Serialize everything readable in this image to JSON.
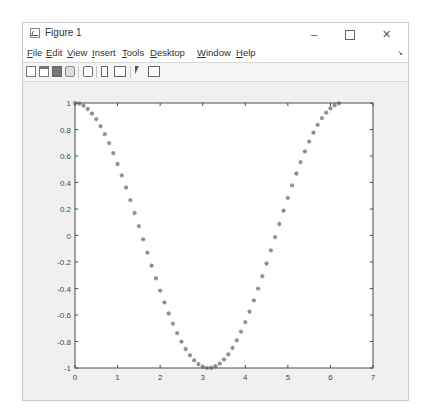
{
  "window": {
    "title": "Figure 1",
    "controls": {
      "minimize": "–",
      "maximize": "□",
      "close": "✕"
    }
  },
  "menubar": {
    "items": [
      "File",
      "Edit",
      "View",
      "Insert",
      "Tools",
      "Desktop",
      "Window",
      "Help"
    ],
    "dock_arrow": "↘"
  },
  "toolbar": {
    "icons": [
      "new-figure-icon",
      "open-file-icon",
      "save-icon",
      "print-icon",
      "zoom-icon",
      "insert-colorbar-icon",
      "insert-legend-icon",
      "edit-plot-cursor-icon",
      "property-editor-icon"
    ]
  },
  "colors": {
    "marker": "#8c8c8c",
    "axes": "#4d4d4d",
    "figure_bg": "#f0f0f0",
    "axes_bg": "#ffffff"
  },
  "chart_data": {
    "type": "scatter",
    "title": "",
    "xlabel": "",
    "ylabel": "",
    "marker": "*",
    "xlim": [
      0,
      7
    ],
    "ylim": [
      -1,
      1
    ],
    "xticks": [
      "0",
      "1",
      "2",
      "3",
      "4",
      "5",
      "6",
      "7"
    ],
    "yticks": [
      "1",
      "0.8",
      "0.6",
      "0.4",
      "0.2",
      "0",
      "-0.2",
      "-0.4",
      "-0.6",
      "-0.8",
      "-1"
    ],
    "grid": false,
    "legend": null,
    "series": [
      {
        "name": "cos(x)",
        "x": [
          0,
          0.1,
          0.2,
          0.3,
          0.4,
          0.5,
          0.6,
          0.7,
          0.8,
          0.9,
          1.0,
          1.1,
          1.2,
          1.3,
          1.4,
          1.5,
          1.6,
          1.7,
          1.8,
          1.9,
          2.0,
          2.1,
          2.2,
          2.3,
          2.4,
          2.5,
          2.6,
          2.7,
          2.8,
          2.9,
          3.0,
          3.1,
          3.2,
          3.3,
          3.4,
          3.5,
          3.6,
          3.7,
          3.8,
          3.9,
          4.0,
          4.1,
          4.2,
          4.3,
          4.4,
          4.5,
          4.6,
          4.7,
          4.8,
          4.9,
          5.0,
          5.1,
          5.2,
          5.3,
          5.4,
          5.5,
          5.6,
          5.7,
          5.8,
          5.9,
          6.0,
          6.1,
          6.2
        ],
        "y": [
          1.0,
          0.995,
          0.98,
          0.955,
          0.921,
          0.878,
          0.825,
          0.765,
          0.697,
          0.622,
          0.54,
          0.454,
          0.362,
          0.267,
          0.17,
          0.071,
          -0.029,
          -0.129,
          -0.227,
          -0.323,
          -0.416,
          -0.505,
          -0.589,
          -0.666,
          -0.737,
          -0.801,
          -0.857,
          -0.904,
          -0.942,
          -0.971,
          -0.99,
          -0.999,
          -0.998,
          -0.987,
          -0.967,
          -0.936,
          -0.897,
          -0.848,
          -0.791,
          -0.726,
          -0.654,
          -0.575,
          -0.49,
          -0.401,
          -0.307,
          -0.211,
          -0.112,
          -0.012,
          0.087,
          0.187,
          0.284,
          0.378,
          0.468,
          0.554,
          0.634,
          0.709,
          0.776,
          0.835,
          0.886,
          0.927,
          0.96,
          0.983,
          0.997
        ]
      }
    ]
  }
}
